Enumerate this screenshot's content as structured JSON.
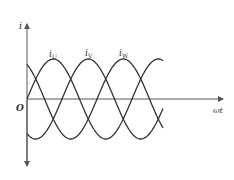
{
  "axes": {
    "y_label": "i",
    "x_label": "ωt",
    "origin_label": "O"
  },
  "curves": [
    {
      "name": "iU",
      "label_main": "i",
      "label_sub": "U",
      "phase_deg": 0
    },
    {
      "name": "iV",
      "label_main": "i",
      "label_sub": "V",
      "phase_deg": -120
    },
    {
      "name": "iW",
      "label_main": "i",
      "label_sub": "W",
      "phase_deg": -240
    }
  ],
  "colors": {
    "line": "#333333",
    "axis": "#555555",
    "background": "#ffffff"
  },
  "chart_data": {
    "type": "line",
    "title": "",
    "xlabel": "ωt",
    "ylabel": "i",
    "series": [
      {
        "name": "iU",
        "function": "Im·sin(ωt)"
      },
      {
        "name": "iV",
        "function": "Im·sin(ωt − 120°)"
      },
      {
        "name": "iW",
        "function": "Im·sin(ωt + 120°)"
      }
    ],
    "x_range_deg": [
      0,
      480
    ],
    "grid": false,
    "legend": "inline labels above peaks"
  }
}
